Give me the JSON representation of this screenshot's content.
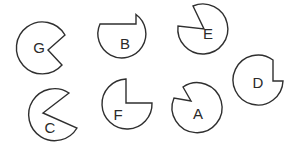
{
  "figure": {
    "stroke_color": "#2f2f2f",
    "background": "#ffffff",
    "shapes": [
      {
        "label": "G",
        "label_pos": [
          39,
          47
        ],
        "d": "M 65 35 L 48 50 L 62 65 A 26 26 0 1 1 65 35 Z"
      },
      {
        "label": "B",
        "label_pos": [
          125,
          43
        ],
        "d": "M 100 24 L 136 24 L 136 14.5 A 24 24 0 1 1 100 24 Z"
      },
      {
        "label": "E",
        "label_pos": [
          208,
          33
        ],
        "d": "M 193 6 L 204 29 L 178 26 A 25 25 0 1 0 193 6 Z"
      },
      {
        "label": "D",
        "label_pos": [
          258,
          82
        ],
        "d": "M 273 60 L 273 81 L 283 81 A 25 25 0 1 1 273 60 Z"
      },
      {
        "label": "C",
        "label_pos": [
          50,
          127
        ],
        "d": "M 69 93 L 43 113 L 77 128 A 26 26 0 1 1 69 93 Z"
      },
      {
        "label": "F",
        "label_pos": [
          118,
          114
        ],
        "d": "M 126 79 L 126 103 L 152 103 A 25 25 0 1 1 126 79 Z"
      },
      {
        "label": "A",
        "label_pos": [
          198,
          113
        ],
        "d": "M 183 87 L 191 101 L 174 98 A 25 25 0 1 0 183 87 Z"
      }
    ]
  }
}
